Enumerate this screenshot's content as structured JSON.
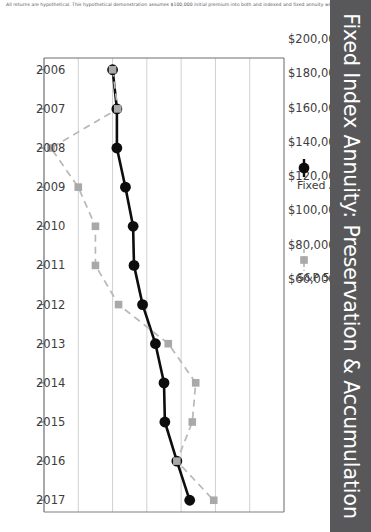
{
  "banner": {
    "title": "Fixed Index Annuity: Preservation & Accumulation",
    "color": "#58585a"
  },
  "footnote": {
    "text": "All returns are hypothetical. This hypothetical demonstration assumes $100,000 initial premium into both and indexed and fixed annuity with a minimum"
  },
  "chart_data": {
    "type": "line",
    "title": "Fixed Index Annuity: Preservation & Accumulation",
    "xlabel": "",
    "ylabel": "",
    "grid": true,
    "legend_position": "top",
    "orientation": "rotated-90",
    "x": [
      "2006",
      "2007",
      "2008",
      "2009",
      "2010",
      "2011",
      "2012",
      "2013",
      "2014",
      "2015",
      "2016",
      "2017"
    ],
    "categories": [
      "2006",
      "2007",
      "2008",
      "2009",
      "2010",
      "2011",
      "2012",
      "2013",
      "2014",
      "2015",
      "2016",
      "2017"
    ],
    "yticks": [
      "$60,000",
      "$80,000",
      "$100,000",
      "$120,000",
      "$140,000",
      "$160,000",
      "$180,000",
      "$200,000"
    ],
    "ytickvalues": [
      60000,
      80000,
      100000,
      120000,
      140000,
      160000,
      180000,
      200000
    ],
    "ylim": [
      60000,
      200000
    ],
    "series": [
      {
        "name": "Fixed Annuity",
        "color": "#0d0d0d",
        "marker": "circle",
        "linestyle": "solid",
        "values": [
          100000,
          102500,
          102500,
          107500,
          112000,
          112500,
          117500,
          125000,
          130000,
          130500,
          137500,
          145000
        ]
      },
      {
        "name": "S&P 500",
        "color": "#a9a9a9",
        "marker": "square",
        "linestyle": "dashed",
        "values": [
          100000,
          103000,
          64000,
          80000,
          90000,
          90000,
          103500,
          132500,
          148500,
          146500,
          137500,
          159000
        ]
      }
    ]
  },
  "legend": {
    "items": [
      {
        "label": "Fixed Annuity",
        "marker": "circle-marker",
        "color": "#0d0d0d"
      },
      {
        "label": "S&P 500",
        "marker": "square-marker",
        "color": "#a9a9a9"
      }
    ]
  }
}
